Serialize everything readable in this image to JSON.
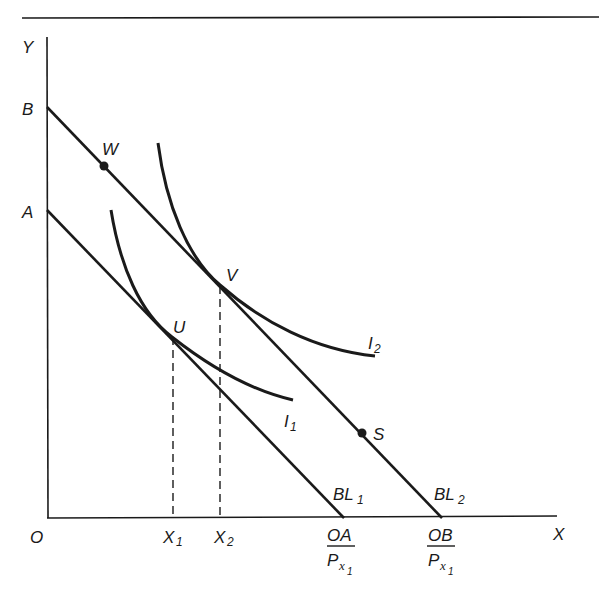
{
  "diagram": {
    "type": "indifference-curve-budget-line",
    "axes": {
      "y_label": "Y",
      "x_label": "X",
      "origin_label": "O"
    },
    "y_intercepts": [
      {
        "label": "A",
        "line": "BL1"
      },
      {
        "label": "B",
        "line": "BL2"
      }
    ],
    "budget_lines": [
      {
        "name": "BL",
        "subscript": "1",
        "x_intercept_num": "OA",
        "x_intercept_den": "P",
        "den_sub": "x",
        "den_subsub": "1"
      },
      {
        "name": "BL",
        "subscript": "2",
        "x_intercept_num": "OB",
        "x_intercept_den": "P",
        "den_sub": "x",
        "den_subsub": "1"
      }
    ],
    "indifference_curves": [
      {
        "name": "I",
        "subscript": "1",
        "tangent_point": "U"
      },
      {
        "name": "I",
        "subscript": "2",
        "tangent_point": "V"
      }
    ],
    "points": [
      {
        "label": "W",
        "on": "BL2",
        "marked": true
      },
      {
        "label": "S",
        "on": "BL2",
        "marked": true
      },
      {
        "label": "V",
        "on": "BL2",
        "tangency": "I2"
      },
      {
        "label": "U",
        "on": "BL1",
        "tangency": "I1"
      }
    ],
    "x_markers": [
      {
        "label": "X",
        "subscript": "1",
        "from_point": "U"
      },
      {
        "label": "X",
        "subscript": "2",
        "from_point": "V"
      }
    ],
    "colors": {
      "ink": "#1a1a1a",
      "background": "#ffffff"
    }
  }
}
